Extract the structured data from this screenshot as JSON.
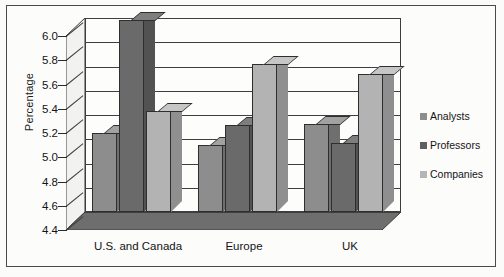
{
  "chart_data": {
    "type": "bar",
    "title": "",
    "xlabel": "",
    "ylabel": "Percentage",
    "ylim": [
      4.4,
      6.0
    ],
    "ytick_labels": [
      "6.0",
      "5.8",
      "5.6",
      "5.4",
      "5.2",
      "5.0",
      "4.8",
      "4.6",
      "4.4"
    ],
    "ytick_values": [
      6.0,
      5.8,
      5.6,
      5.4,
      5.2,
      5.0,
      4.8,
      4.6,
      4.4
    ],
    "grid": true,
    "legend_position": "right",
    "style": "3d-grouped-bar",
    "categories": [
      "U.S. and Canada",
      "Europe",
      "UK"
    ],
    "series": [
      {
        "name": "Analysts",
        "values": [
          5.05,
          4.95,
          5.13
        ],
        "color": "#8d8d8d"
      },
      {
        "name": "Professors",
        "values": [
          5.98,
          5.12,
          4.97
        ],
        "color": "#5f5f5f"
      },
      {
        "name": "Companies",
        "values": [
          5.23,
          5.62,
          5.54
        ],
        "color": "#b5b5b5"
      }
    ]
  },
  "axis": {
    "y_label": "Percentage",
    "y_ticks": [
      "6.0",
      "5.8",
      "5.6",
      "5.4",
      "5.2",
      "5.0",
      "4.8",
      "4.6",
      "4.4"
    ],
    "x_ticks": [
      "U.S. and Canada",
      "Europe",
      "UK"
    ]
  },
  "legend": {
    "items": [
      {
        "label": "Analysts",
        "swatch": "analysts-swatch"
      },
      {
        "label": "Professors",
        "swatch": "professors-swatch"
      },
      {
        "label": "Companies",
        "swatch": "companies-swatch"
      }
    ]
  }
}
